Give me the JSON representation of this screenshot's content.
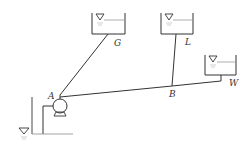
{
  "diagram": {
    "type": "pipe network with pump and reservoirs",
    "colors": {
      "line": "#333333",
      "water_line": "#999999",
      "background": "#ffffff"
    },
    "nodes": {
      "A": {
        "label": "A",
        "desc": "pump outlet junction"
      },
      "B": {
        "label": "B",
        "desc": "pipe junction"
      },
      "G": {
        "label": "G",
        "desc": "upper reservoir G"
      },
      "L": {
        "label": "L",
        "desc": "upper reservoir L"
      },
      "W": {
        "label": "W",
        "desc": "reservoir W"
      }
    },
    "pipes": [
      {
        "from": "A",
        "to": "G"
      },
      {
        "from": "A",
        "to": "B"
      },
      {
        "from": "B",
        "to": "L"
      },
      {
        "from": "B",
        "to": "W"
      }
    ],
    "components": [
      "pump",
      "suction sump"
    ]
  }
}
